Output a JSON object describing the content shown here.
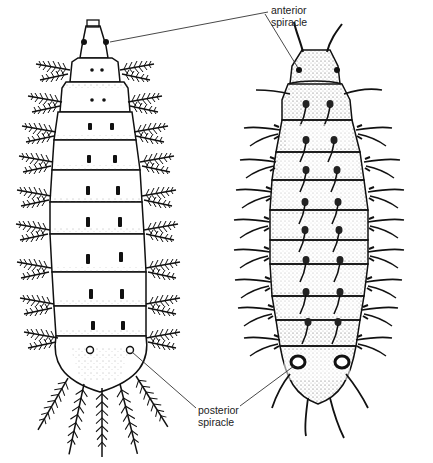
{
  "figure": {
    "specimens": [
      {
        "id": "left",
        "position": "left",
        "segments": 11,
        "process_type": "feathered (plumose) lateral processes"
      },
      {
        "id": "right",
        "position": "right",
        "segments": 11,
        "process_type": "slender curved spines with dorsal pairs"
      }
    ],
    "labels": {
      "anterior": {
        "line1": "anterior",
        "line2": "spiracle"
      },
      "posterior": {
        "line1": "posterior",
        "line2": "spiracle"
      }
    },
    "colors": {
      "ink": "#111111",
      "background": "#ffffff",
      "label": "#222222"
    }
  }
}
